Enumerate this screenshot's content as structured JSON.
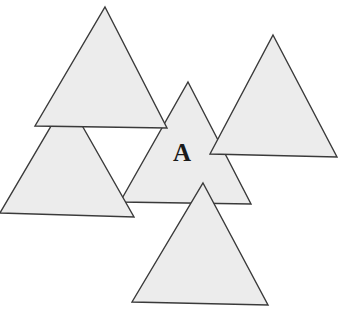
{
  "diagram": {
    "label": "A",
    "fill_color": "#ececec",
    "stroke_color": "#3a3a3a",
    "triangles": [
      {
        "name": "center",
        "points": "188,82 251,204 120,202"
      },
      {
        "name": "right",
        "points": "273,35 337,157 210,154"
      },
      {
        "name": "lower-left",
        "points": "67,99 134,217 0,213"
      },
      {
        "name": "top-left",
        "points": "105,7 167,128 35,126"
      },
      {
        "name": "bottom",
        "points": "203,183 268,305 132,302"
      }
    ]
  }
}
